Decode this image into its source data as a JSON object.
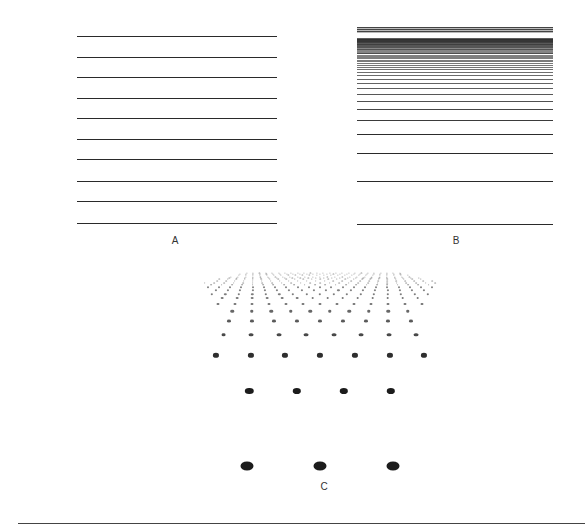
{
  "panels": {
    "A": {
      "label": "A",
      "line_count": 10,
      "x": 77,
      "width": 200,
      "line_y": [
        36,
        57,
        77,
        98,
        118,
        139,
        159,
        181,
        201,
        223
      ]
    },
    "B": {
      "label": "B",
      "x": 357,
      "width": 196,
      "top": 27,
      "bottom": 224,
      "line_y_sample_bottom": [
        94,
        102,
        111,
        121,
        133,
        149,
        168,
        192,
        224
      ]
    },
    "C": {
      "label": "C",
      "dot_rows_sample": [
        {
          "y": 347,
          "x": [
            246,
            283,
            320,
            357,
            394
          ]
        },
        {
          "y": 358,
          "x": [
            218,
            260,
            300,
            341,
            381
          ]
        },
        {
          "y": 372,
          "x": [
            231,
            276,
            320,
            365,
            409
          ]
        },
        {
          "y": 387,
          "x": [
            246,
            296,
            345,
            394
          ]
        },
        {
          "y": 406,
          "x": [
            265,
            320,
            376
          ]
        },
        {
          "y": 431,
          "x": [
            226,
            289,
            352,
            415
          ]
        },
        {
          "y": 463,
          "x": [
            248,
            321,
            395
          ]
        }
      ]
    }
  },
  "colors": {
    "ink": "#1c1c1c",
    "background": "#ffffff"
  }
}
